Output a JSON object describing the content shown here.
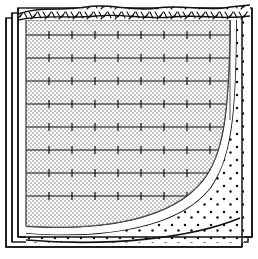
{
  "figure": {
    "kind": "stratigraphic-section",
    "background_color": "#ffffff",
    "line_color": "#000000",
    "stipple_color": "#b9b9b9"
  },
  "block": {
    "outer_frame": {
      "x": 6,
      "y": 14,
      "width": 238,
      "height": 233
    },
    "mid_frame": {
      "x": 12,
      "y": 10,
      "width": 238,
      "height": 233
    },
    "inner_frame": {
      "x": 18,
      "y": 6,
      "width": 234,
      "height": 233
    },
    "offset_note": "three nested rectangles offset up-right give a 3D slab effect"
  },
  "layers": [
    {
      "id": "turf-cap",
      "label": "Turf / topsoil cap",
      "texture": "dashes",
      "fill": "#ffffff",
      "position": "top band with ragged upper edge"
    },
    {
      "id": "main-fill",
      "label": "Reinforced fill body",
      "texture": "checker-stipple",
      "fill": "#cfcfcf",
      "position": "main interior mass"
    },
    {
      "id": "void-band",
      "label": "Unfilled separation band",
      "texture": "none",
      "fill": "#ffffff",
      "position": "curved band lower-right"
    },
    {
      "id": "sand-layer",
      "label": "Sand / fine granular layer",
      "texture": "dots",
      "fill": "#ffffff",
      "position": "curved band below void band"
    },
    {
      "id": "rubble-layer",
      "label": "Gravel / rubble base",
      "texture": "slashes",
      "fill": "#ffffff",
      "position": "lower-right wedge"
    }
  ],
  "reinforcement": {
    "label": "Reinforcement sheets",
    "line_count": 8,
    "line_spacing_px": 23,
    "first_line_y": 35,
    "tick_spacing_px": 23,
    "tick_half_height_px": 4,
    "description": "horizontal lines bearing regular vertical tick marks"
  },
  "grid_area": {
    "x": 26,
    "y": 20,
    "width": 204,
    "height": 200
  },
  "curves": {
    "inner_boundary": "M 26 224 C 80 228 150 214 182 176 C 200 154 206 120 206 20",
    "void_outer": "M 26 231 C 86 236 160 222 192 182 C 212 156 219 118 219 20",
    "sand_outer": "M 26 238 C 94 243 172 229 204 188 C 226 160 232 118 232 20",
    "base_line": "M 26 243 C 100 248 186 240 232 224"
  }
}
